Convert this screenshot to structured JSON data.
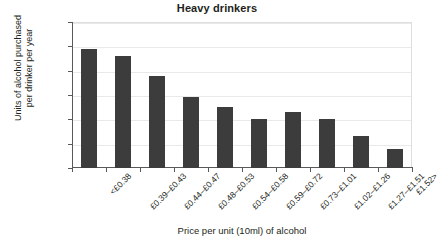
{
  "chart_data": {
    "type": "bar",
    "title": "Heavy drinkers",
    "xlabel": "Price per unit (10ml) of alcohol",
    "ylabel": "Units of alcohol purchased\nper drinker per year",
    "categories": [
      "<£0.38",
      "£0.39–£0.43",
      "£0.44–£0.47",
      "£0.48–£0.53",
      "£0.54–£0.58",
      "£0.59–£0.72",
      "£0.73–£1.01",
      "£1.02–£1.26",
      "£1.27–£1.51",
      "£1.52>"
    ],
    "values": [
      975,
      920,
      755,
      585,
      500,
      405,
      460,
      400,
      260,
      160
    ],
    "ylim": [
      0,
      1200
    ],
    "yticks": [
      0,
      200,
      400,
      600,
      800,
      1000,
      1200
    ],
    "ytick_labels": [
      "0",
      "200",
      "400",
      "600",
      "800",
      "1000",
      "1200"
    ],
    "grid": true,
    "legend": false,
    "bar_color": "#3c3c3c",
    "grid_color": "#e9e9e9",
    "axis_color": "#58595b",
    "text_color": "#231f20"
  }
}
